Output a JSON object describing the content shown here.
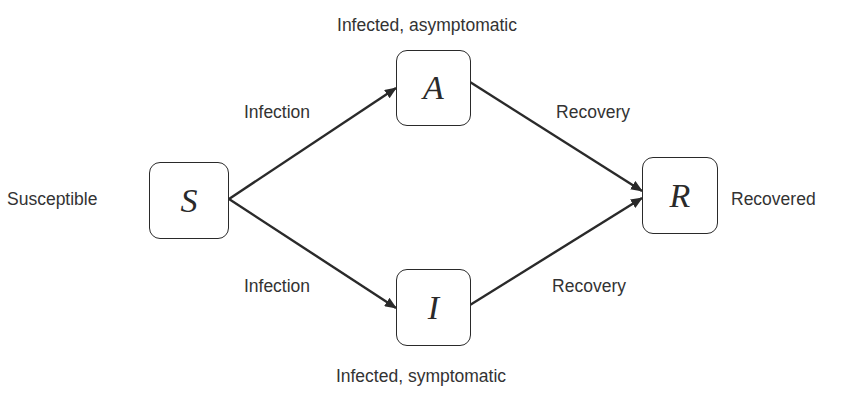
{
  "diagram": {
    "colors": {
      "stroke": "#2a2a2a",
      "text": "#333333",
      "background": "#ffffff"
    },
    "nodes": [
      {
        "id": "S",
        "symbol": "S",
        "label": "Susceptible",
        "label_position": "left"
      },
      {
        "id": "A",
        "symbol": "A",
        "label": "Infected, asymptomatic",
        "label_position": "top"
      },
      {
        "id": "I",
        "symbol": "I",
        "label": "Infected, symptomatic",
        "label_position": "bottom"
      },
      {
        "id": "R",
        "symbol": "R",
        "label": "Recovered",
        "label_position": "right"
      }
    ],
    "edges": [
      {
        "from": "S",
        "to": "A",
        "label": "Infection"
      },
      {
        "from": "S",
        "to": "I",
        "label": "Infection"
      },
      {
        "from": "A",
        "to": "R",
        "label": "Recovery"
      },
      {
        "from": "I",
        "to": "R",
        "label": "Recovery"
      }
    ]
  }
}
